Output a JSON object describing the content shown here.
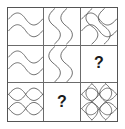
{
  "puzzle": {
    "type": "matrix-reasoning-grid",
    "rows": 3,
    "columns": 3,
    "stroke_color": "#4a4a4a",
    "grid_line_color": "#6b6b6b",
    "frame_color": "#555555",
    "background_color": "#ffffff",
    "missing_marker": "?",
    "cells": [
      {
        "position": "top-left",
        "row": 1,
        "column": 1,
        "pattern": "double-horizontal-s-wave",
        "description": "Two stacked horizontal S-shaped wavy lines spanning the cell width",
        "wave_count": 2,
        "orientation": "horizontal",
        "is_missing": false,
        "label": ""
      },
      {
        "position": "top-center",
        "row": 1,
        "column": 2,
        "pattern": "double-vertical-s-wave",
        "description": "Two side-by-side vertical S-shaped wavy lines spanning the cell height",
        "wave_count": 2,
        "orientation": "vertical",
        "is_missing": false,
        "label": ""
      },
      {
        "position": "top-right",
        "row": 1,
        "column": 3,
        "pattern": "interlaced-swirl-lattice",
        "description": "Overlapping horizontal and vertical S-waves crossing to form a pinwheel swirl lattice",
        "wave_count": 4,
        "orientation": "crossed",
        "is_missing": false,
        "label": ""
      },
      {
        "position": "middle-left",
        "row": 2,
        "column": 1,
        "pattern": "double-horizontal-s-wave",
        "description": "Two stacked horizontal S-shaped wavy lines spanning the cell width",
        "wave_count": 2,
        "orientation": "horizontal",
        "is_missing": false,
        "label": ""
      },
      {
        "position": "middle-center",
        "row": 2,
        "column": 2,
        "pattern": "double-vertical-s-wave",
        "description": "Two side-by-side vertical S-shaped wavy lines spanning the cell height",
        "wave_count": 2,
        "orientation": "vertical",
        "is_missing": false,
        "label": ""
      },
      {
        "position": "middle-right",
        "row": 2,
        "column": 3,
        "pattern": "missing",
        "description": "Empty cell containing a question mark",
        "wave_count": 0,
        "orientation": "none",
        "is_missing": true,
        "label": "?"
      },
      {
        "position": "bottom-left",
        "row": 3,
        "column": 1,
        "pattern": "lens-row-pairs",
        "description": "Two rows of paired lens/eye shapes formed by mirrored horizontal waves",
        "wave_count": 4,
        "orientation": "horizontal",
        "is_missing": false,
        "label": ""
      },
      {
        "position": "bottom-center",
        "row": 3,
        "column": 2,
        "pattern": "missing",
        "description": "Empty cell containing a question mark",
        "wave_count": 0,
        "orientation": "none",
        "is_missing": true,
        "label": "?"
      },
      {
        "position": "bottom-right",
        "row": 3,
        "column": 3,
        "pattern": "circle-lattice-rosette",
        "description": "Dense lattice of overlapping circles and lens shapes forming a rosette grid",
        "wave_count": 8,
        "orientation": "crossed",
        "is_missing": false,
        "label": ""
      }
    ]
  }
}
